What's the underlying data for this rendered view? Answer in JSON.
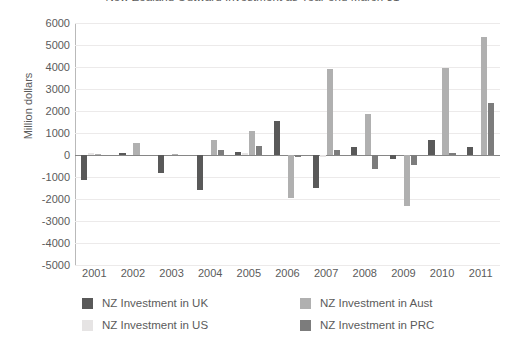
{
  "chart_data": {
    "type": "bar",
    "title": "New Zealand Outward Investment as Year end March 31",
    "xlabel": "",
    "ylabel": "Million dollars",
    "ylim": [
      -5000,
      6000
    ],
    "ytick_step": 1000,
    "grid": true,
    "legend_position": "bottom",
    "categories": [
      "2001",
      "2002",
      "2003",
      "2004",
      "2005",
      "2006",
      "2007",
      "2008",
      "2009",
      "2010",
      "2011"
    ],
    "series": [
      {
        "name": "NZ Investment in UK",
        "color": "#595959",
        "values": [
          -1150,
          100,
          -800,
          -1600,
          150,
          1550,
          -1500,
          350,
          -200,
          700,
          350
        ]
      },
      {
        "name": "NZ Investment in US",
        "color": "#e6e4e4",
        "values": [
          100,
          0,
          0,
          0,
          100,
          0,
          -100,
          0,
          0,
          0,
          0
        ]
      },
      {
        "name": "NZ Investment in Aust",
        "color": "#b0b0b0",
        "values": [
          50,
          550,
          50,
          700,
          1100,
          -1950,
          3900,
          1850,
          -2300,
          3950,
          5350
        ]
      },
      {
        "name": "NZ Investment in PRC",
        "color": "#7c7c7c",
        "values": [
          0,
          0,
          0,
          250,
          400,
          -100,
          250,
          -650,
          -450,
          100,
          2350
        ]
      }
    ],
    "y_tick_labels": [
      "6000",
      "5000",
      "4000",
      "3000",
      "2000",
      "1000",
      "0",
      "-1000",
      "-2000",
      "-3000",
      "-4000",
      "-5000"
    ]
  },
  "legend": {
    "entries": [
      {
        "label": "NZ Investment in UK",
        "color": "#595959"
      },
      {
        "label": "NZ Investment in Aust",
        "color": "#b0b0b0"
      },
      {
        "label": "NZ Investment in US",
        "color": "#e6e4e4"
      },
      {
        "label": "NZ Investment in PRC",
        "color": "#7c7c7c"
      }
    ]
  }
}
